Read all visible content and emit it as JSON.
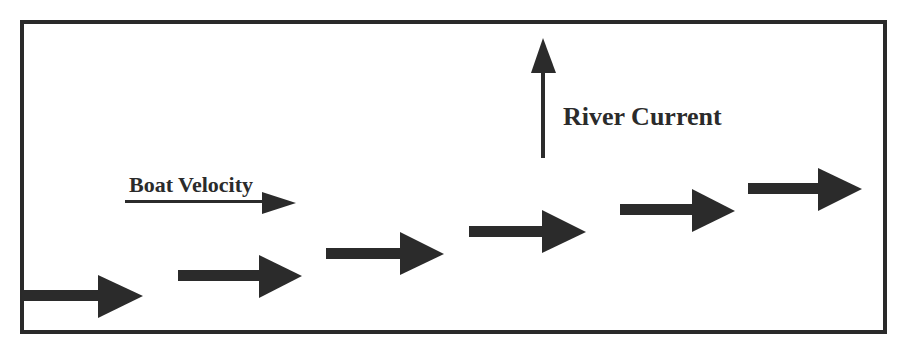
{
  "diagram": {
    "colors": {
      "stroke": "#2a2a2a",
      "arrow_fill": "#2b2b2b",
      "background": "#ffffff"
    },
    "labels": {
      "river_current": "River Current",
      "boat_velocity": "Boat Velocity"
    },
    "legend_arrows": [
      {
        "name": "river-current-arrow",
        "direction": "up"
      },
      {
        "name": "boat-velocity-arrow",
        "direction": "right"
      }
    ],
    "path_arrows": [
      {
        "index": 1,
        "direction": "right"
      },
      {
        "index": 2,
        "direction": "right"
      },
      {
        "index": 3,
        "direction": "right"
      },
      {
        "index": 4,
        "direction": "right"
      },
      {
        "index": 5,
        "direction": "right"
      },
      {
        "index": 6,
        "direction": "right"
      }
    ]
  }
}
